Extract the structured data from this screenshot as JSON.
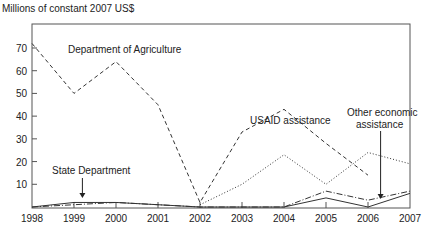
{
  "chart_data": {
    "type": "line",
    "title": "",
    "ylabel": "Millions of constant 2007 US$",
    "xlabel": "",
    "x": [
      1998,
      1999,
      2000,
      2001,
      2002,
      2003,
      2004,
      2005,
      2006,
      2007
    ],
    "xticks": [
      "1998",
      "1999",
      "2000",
      "2001",
      "2002",
      "2003",
      "2004",
      "2005",
      "2006",
      "2007"
    ],
    "yticks": [
      "10",
      "20",
      "30",
      "40",
      "50",
      "60",
      "70"
    ],
    "ytick_values": [
      10,
      20,
      30,
      40,
      50,
      60,
      70
    ],
    "ylim": [
      0,
      81
    ],
    "xlim": [
      1998,
      2007
    ],
    "grid": false,
    "legend": "none (inline annotations)",
    "series": [
      {
        "name": "Department of Agriculture",
        "style": "dashed",
        "x": [
          1998,
          1999,
          2000,
          2001,
          2002,
          2003,
          2004,
          2005,
          2006
        ],
        "values": [
          72,
          50,
          64,
          45,
          2,
          33,
          43,
          28,
          14
        ]
      },
      {
        "name": "USAID assistance",
        "style": "dotted",
        "x": [
          2002,
          2003,
          2004,
          2005,
          2006,
          2007
        ],
        "values": [
          1,
          10,
          23,
          10,
          24,
          19
        ]
      },
      {
        "name": "State Department",
        "style": "solid",
        "x": [
          1998,
          1999,
          2000,
          2001,
          2002,
          2003,
          2004,
          2005,
          2006,
          2007
        ],
        "values": [
          0,
          2,
          2,
          1,
          0,
          0,
          0,
          4,
          0,
          6
        ]
      },
      {
        "name": "Other economic assistance",
        "style": "dash-dot",
        "x": [
          1998,
          1999,
          2000,
          2001,
          2002,
          2003,
          2004,
          2005,
          2006,
          2007
        ],
        "values": [
          0,
          1,
          2,
          1,
          0,
          0,
          0,
          7,
          3,
          7
        ]
      }
    ],
    "annotations": [
      {
        "text": "Department of Agriculture",
        "series": "Department of Agriculture"
      },
      {
        "text": "USAID assistance",
        "series": "USAID assistance"
      },
      {
        "text": "State Department",
        "series": "State Department",
        "arrow": true,
        "arrow_x": 1999.2
      },
      {
        "text": "Other economic",
        "text2": "assistance",
        "series": "Other economic assistance",
        "arrow": true,
        "arrow_x": 2006.3
      }
    ]
  }
}
